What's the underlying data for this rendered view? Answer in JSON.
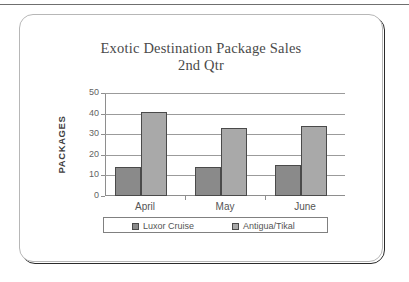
{
  "slide": {
    "frame_name": "presentation-slide-frame"
  },
  "chart_data": {
    "type": "bar",
    "title": "Exotic Destination Package Sales",
    "subtitle": "2nd Qtr",
    "xlabel": "",
    "ylabel": "PACKAGES",
    "ylim": [
      0,
      50
    ],
    "ytick_labels": [
      "50",
      "40",
      "30",
      "20",
      "10",
      "0"
    ],
    "ytick_values": [
      50,
      40,
      30,
      20,
      10,
      0
    ],
    "grid": true,
    "legend_position": "bottom",
    "categories": [
      "April",
      "May",
      "June"
    ],
    "series": [
      {
        "name": "Luxor Cruise",
        "color": "#8a8a8a",
        "values": [
          14,
          14,
          15
        ]
      },
      {
        "name": "Antigua/Tikal",
        "color": "#a9a9a9",
        "values": [
          41,
          33,
          34
        ]
      }
    ]
  }
}
